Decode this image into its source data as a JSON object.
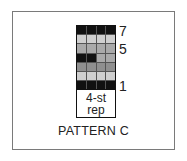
{
  "chart": {
    "title": "PATTERN C",
    "repeat_label_line1": "4-st",
    "repeat_label_line2": "rep",
    "row_labels": [
      {
        "row": 7,
        "label": "7"
      },
      {
        "row": 5,
        "label": "5"
      },
      {
        "row": 1,
        "label": "1"
      }
    ],
    "columns": 4,
    "rows_top_to_bottom": [
      {
        "row": 7,
        "cells": [
          "black",
          "black",
          "black",
          "black"
        ]
      },
      {
        "row": 6,
        "cells": [
          "light",
          "light",
          "light",
          "light"
        ]
      },
      {
        "row": 5,
        "cells": [
          "mid",
          "mid",
          "mid",
          "mid"
        ]
      },
      {
        "row": 4,
        "cells": [
          "black",
          "black",
          "mid",
          "mid"
        ]
      },
      {
        "row": 3,
        "cells": [
          "dark",
          "dark",
          "dark",
          "dark"
        ]
      },
      {
        "row": 2,
        "cells": [
          "light",
          "light",
          "light",
          "light"
        ]
      },
      {
        "row": 1,
        "cells": [
          "black",
          "black",
          "black",
          "black"
        ]
      }
    ],
    "colors": {
      "black": "#111111",
      "light": "#cfcfcf",
      "mid": "#a9a9a9",
      "dark": "#8f8f8f",
      "frame": "#7a7a7a"
    }
  }
}
